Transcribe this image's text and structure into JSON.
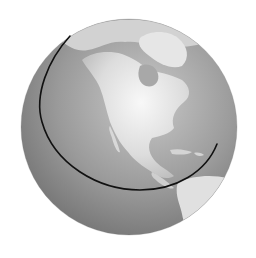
{
  "image": {
    "subject": "globe",
    "view": "North America",
    "style": "grayscale"
  },
  "colors": {
    "background": "#ffffff",
    "ocean_light": "#b4b4b4",
    "ocean_dark": "#6e6e6e",
    "land_light": "#f2f2f2",
    "land_mid": "#cfcfcf",
    "arc": "#111111"
  },
  "elements": {
    "arc_label": "orbit-arc"
  }
}
